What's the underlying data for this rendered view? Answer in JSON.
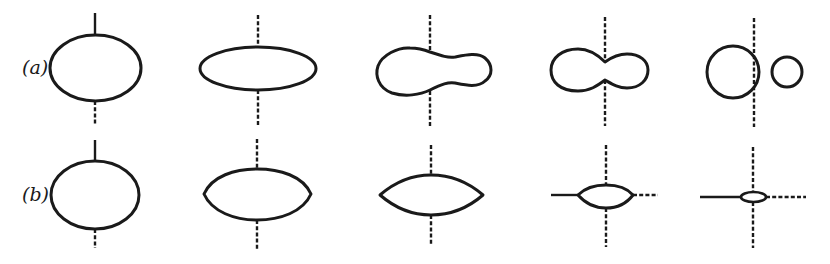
{
  "figure": {
    "rows": [
      {
        "label": "(a)",
        "description": "Liquid-drop fission sequence: sphere deforms, elongates, necks, splits into two fragments",
        "stages": [
          "sphere",
          "elongated ellipsoid",
          "beginning neck",
          "deep neck",
          "two separated spheres"
        ]
      },
      {
        "label": "(b)",
        "description": "Alternative deformation: lens shape flattening with equatorial cusp lines",
        "stages": [
          "sphere",
          "oblate lens",
          "pointed lens",
          "small lens with equatorial lines",
          "tiny lens with equatorial lines"
        ]
      }
    ],
    "colors": {
      "ink": "#1a1a1a",
      "background": "#ffffff"
    }
  }
}
